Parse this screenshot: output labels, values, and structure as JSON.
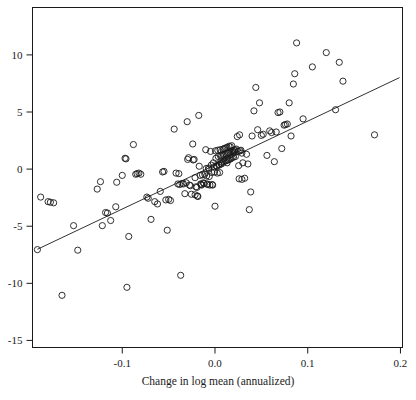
{
  "chart_data": {
    "type": "scatter",
    "title": "",
    "subtitle": "",
    "xlabel": "Change in log mean (annualized)",
    "ylabel": "",
    "xlim": [
      -0.1968,
      0.2022
    ],
    "ylim": [
      -15.62,
      14.15
    ],
    "grid": false,
    "legend": null,
    "xticks": [
      -0.1,
      0.0,
      0.1,
      0.2
    ],
    "xticklabels": [
      "-0.1",
      "0.0",
      "0.1",
      "0.2"
    ],
    "yticks": [
      -15,
      -10,
      -5,
      0,
      5,
      10
    ],
    "yticklabels": [
      "-15",
      "-10",
      "-5",
      "0",
      "5",
      "10"
    ],
    "marker": {
      "shape": "circle",
      "filled": false,
      "edge_color": "#1a1a1a",
      "radius_px": 3.1,
      "stroke_px": 0.9
    },
    "box_color": "#1a1a1a",
    "fit_line": {
      "type": "linear",
      "slope": 38.5,
      "intercept": 0.35,
      "x_start": -0.1915,
      "x_end": 0.199,
      "y_start": -7.02,
      "y_end": 8.01,
      "color": "#1a1a1a",
      "width_px": 0.9
    },
    "n_points": 178,
    "points": [
      [
        -0.1915,
        -7.05
      ],
      [
        -0.188,
        -2.45
      ],
      [
        -0.18,
        -2.85
      ],
      [
        -0.1775,
        -2.9
      ],
      [
        -0.174,
        -2.95
      ],
      [
        -0.165,
        -11.05
      ],
      [
        -0.1525,
        -4.95
      ],
      [
        -0.148,
        -7.1
      ],
      [
        -0.127,
        -1.75
      ],
      [
        -0.1235,
        -1.1
      ],
      [
        -0.1215,
        -4.95
      ],
      [
        -0.118,
        -3.8
      ],
      [
        -0.116,
        -3.85
      ],
      [
        -0.1125,
        -4.5
      ],
      [
        -0.107,
        -3.3
      ],
      [
        -0.106,
        -1.15
      ],
      [
        -0.1,
        -0.55
      ],
      [
        -0.097,
        0.95
      ],
      [
        -0.096,
        0.9
      ],
      [
        -0.095,
        -10.35
      ],
      [
        -0.093,
        -5.9
      ],
      [
        -0.088,
        2.15
      ],
      [
        -0.0855,
        -0.45
      ],
      [
        -0.084,
        -0.4
      ],
      [
        -0.082,
        -0.35
      ],
      [
        -0.08,
        -0.45
      ],
      [
        -0.0735,
        -2.45
      ],
      [
        -0.072,
        -2.55
      ],
      [
        -0.069,
        -4.4
      ],
      [
        -0.065,
        -2.85
      ],
      [
        -0.062,
        -3.05
      ],
      [
        -0.059,
        -1.95
      ],
      [
        -0.0565,
        -0.25
      ],
      [
        -0.055,
        -0.2
      ],
      [
        -0.053,
        -2.7
      ],
      [
        -0.0515,
        -5.35
      ],
      [
        -0.05,
        -2.65
      ],
      [
        -0.048,
        -2.75
      ],
      [
        -0.044,
        3.5
      ],
      [
        -0.042,
        -0.35
      ],
      [
        -0.04,
        -1.3
      ],
      [
        -0.039,
        -0.4
      ],
      [
        -0.038,
        -1.35
      ],
      [
        -0.037,
        -9.3
      ],
      [
        -0.0355,
        -1.25
      ],
      [
        -0.034,
        -1.3
      ],
      [
        -0.0325,
        -2.15
      ],
      [
        -0.031,
        -1.2
      ],
      [
        -0.03,
        4.15
      ],
      [
        -0.0295,
        0.85
      ],
      [
        -0.0285,
        1.0
      ],
      [
        -0.0275,
        -1.4
      ],
      [
        -0.0265,
        -1.45
      ],
      [
        -0.0255,
        -2.2
      ],
      [
        -0.024,
        2.2
      ],
      [
        -0.0235,
        0.8
      ],
      [
        -0.0225,
        0.85
      ],
      [
        -0.0215,
        -0.75
      ],
      [
        -0.0205,
        -1.55
      ],
      [
        -0.0195,
        -1.6
      ],
      [
        -0.019,
        -2.35
      ],
      [
        -0.0185,
        -2.4
      ],
      [
        -0.0175,
        4.7
      ],
      [
        -0.017,
        0.25
      ],
      [
        -0.016,
        -0.55
      ],
      [
        -0.0155,
        -1.3
      ],
      [
        -0.015,
        -1.35
      ],
      [
        -0.0145,
        -1.4
      ],
      [
        -0.0135,
        -0.5
      ],
      [
        -0.0125,
        -1.2
      ],
      [
        -0.0118,
        -1.25
      ],
      [
        -0.011,
        -0.45
      ],
      [
        -0.01,
        1.7
      ],
      [
        -0.0095,
        0.05
      ],
      [
        -0.009,
        -0.6
      ],
      [
        -0.0085,
        -1.3
      ],
      [
        -0.008,
        -1.35
      ],
      [
        -0.007,
        0.1
      ],
      [
        -0.0062,
        -0.65
      ],
      [
        -0.0055,
        -1.4
      ],
      [
        -0.0048,
        1.55
      ],
      [
        -0.004,
        0.35
      ],
      [
        -0.0035,
        -0.3
      ],
      [
        -0.003,
        -1.35
      ],
      [
        -0.0025,
        -1.4
      ],
      [
        -0.0018,
        0.55
      ],
      [
        -0.001,
        0.2
      ],
      [
        -0.0005,
        -0.25
      ],
      [
        0.0,
        -3.25
      ],
      [
        0.0005,
        1.6
      ],
      [
        0.001,
        0.95
      ],
      [
        0.0015,
        0.3
      ],
      [
        0.002,
        0.25
      ],
      [
        0.0025,
        -0.35
      ],
      [
        0.003,
        1.65
      ],
      [
        0.0035,
        1.1
      ],
      [
        0.004,
        0.4
      ],
      [
        0.0045,
        0.35
      ],
      [
        0.005,
        -0.3
      ],
      [
        0.0055,
        1.7
      ],
      [
        0.006,
        1.15
      ],
      [
        0.0065,
        0.5
      ],
      [
        0.007,
        0.45
      ],
      [
        0.0075,
        1.2
      ],
      [
        0.008,
        0.6
      ],
      [
        0.0085,
        1.75
      ],
      [
        0.009,
        1.25
      ],
      [
        0.0095,
        0.65
      ],
      [
        0.01,
        1.8
      ],
      [
        0.0105,
        1.3
      ],
      [
        0.011,
        0.7
      ],
      [
        0.0115,
        1.85
      ],
      [
        0.012,
        1.35
      ],
      [
        0.0125,
        0.75
      ],
      [
        0.013,
        1.9
      ],
      [
        0.0135,
        1.4
      ],
      [
        0.014,
        0.8
      ],
      [
        0.0145,
        1.45
      ],
      [
        0.015,
        2.0
      ],
      [
        0.0155,
        0.85
      ],
      [
        0.016,
        1.5
      ],
      [
        0.0165,
        1.95
      ],
      [
        0.017,
        0.9
      ],
      [
        0.0175,
        1.55
      ],
      [
        0.018,
        2.05
      ],
      [
        0.0185,
        1.0
      ],
      [
        0.019,
        1.6
      ],
      [
        0.0195,
        1.45
      ],
      [
        0.02,
        1.05
      ],
      [
        0.0205,
        1.65
      ],
      [
        0.021,
        1.5
      ],
      [
        0.0215,
        1.7
      ],
      [
        0.022,
        1.1
      ],
      [
        0.023,
        1.75
      ],
      [
        0.024,
        2.85
      ],
      [
        0.025,
        1.55
      ],
      [
        0.0255,
        0.3
      ],
      [
        0.026,
        -0.85
      ],
      [
        0.0265,
        3.0
      ],
      [
        0.027,
        1.6
      ],
      [
        0.028,
        1.65
      ],
      [
        0.029,
        -0.9
      ],
      [
        0.03,
        0.55
      ],
      [
        0.032,
        -0.8
      ],
      [
        0.034,
        1.3
      ],
      [
        0.0355,
        0.45
      ],
      [
        0.037,
        -3.55
      ],
      [
        0.0385,
        -2.0
      ],
      [
        0.04,
        2.9
      ],
      [
        0.042,
        5.1
      ],
      [
        0.044,
        7.15
      ],
      [
        0.046,
        3.45
      ],
      [
        0.048,
        5.8
      ],
      [
        0.05,
        2.95
      ],
      [
        0.052,
        3.05
      ],
      [
        0.056,
        1.2
      ],
      [
        0.059,
        3.35
      ],
      [
        0.061,
        3.2
      ],
      [
        0.064,
        0.65
      ],
      [
        0.066,
        3.25
      ],
      [
        0.068,
        4.95
      ],
      [
        0.07,
        5.0
      ],
      [
        0.072,
        1.8
      ],
      [
        0.0745,
        3.85
      ],
      [
        0.076,
        3.9
      ],
      [
        0.078,
        3.95
      ],
      [
        0.08,
        5.8
      ],
      [
        0.082,
        2.9
      ],
      [
        0.0845,
        7.45
      ],
      [
        0.086,
        8.35
      ],
      [
        0.088,
        11.05
      ],
      [
        0.095,
        4.4
      ],
      [
        0.105,
        8.95
      ],
      [
        0.12,
        10.2
      ],
      [
        0.13,
        5.2
      ],
      [
        0.134,
        9.35
      ],
      [
        0.138,
        7.7
      ],
      [
        0.172,
        3.0
      ],
      [
        0.029,
        1.4
      ],
      [
        0.013,
        0.55
      ],
      [
        -0.0065,
        0.0
      ],
      [
        -0.0215,
        -2.25
      ]
    ]
  }
}
